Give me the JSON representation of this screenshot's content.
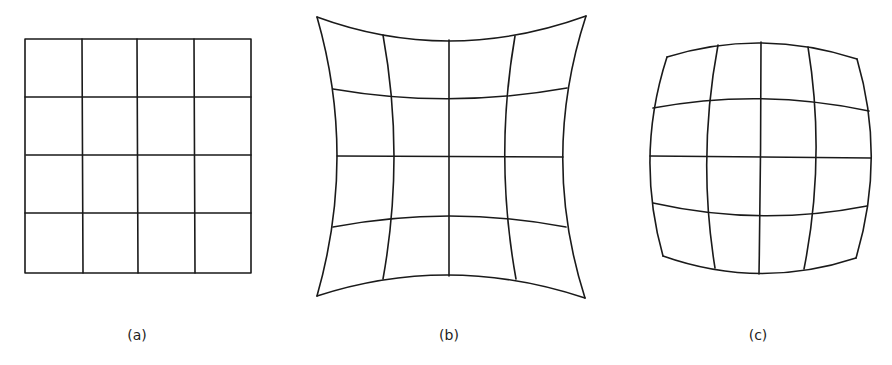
{
  "figure": {
    "panels": [
      {
        "id": "a",
        "label": "(a)",
        "description": "undistorted rectangular grid",
        "rows": 4,
        "cols": 4
      },
      {
        "id": "b",
        "label": "(b)",
        "description": "pincushion distortion grid",
        "rows": 4,
        "cols": 4
      },
      {
        "id": "c",
        "label": "(c)",
        "description": "barrel distortion grid",
        "rows": 4,
        "cols": 4
      }
    ],
    "colors": {
      "line": "#1a1a1a",
      "background": "#ffffff"
    }
  }
}
